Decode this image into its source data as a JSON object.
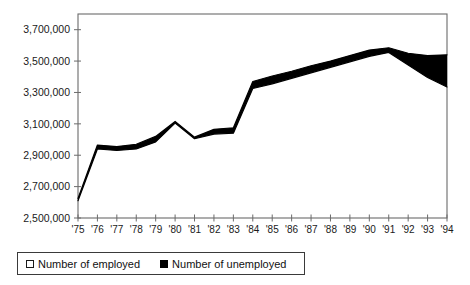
{
  "chart_data": {
    "type": "area",
    "title": "",
    "subtitle": "",
    "xlabel": "",
    "ylabel": "",
    "grid": false,
    "legend_position": "bottom-left",
    "ylim": [
      2500000,
      3800000
    ],
    "ytick_values": [
      2500000,
      2700000,
      2900000,
      3100000,
      3300000,
      3500000,
      3700000
    ],
    "ytick_labels": [
      "2,500,000",
      "2,700,000",
      "2,900,000",
      "3,100,000",
      "3,300,000",
      "3,500,000",
      "3,700,000"
    ],
    "categories": [
      "'75",
      "'76",
      "'77",
      "'78",
      "'79",
      "'80",
      "'81",
      "'82",
      "'83",
      "'84",
      "'85",
      "'86",
      "'87",
      "'88",
      "'89",
      "'90",
      "'91",
      "'92",
      "'93",
      "'94"
    ],
    "x": [
      1975,
      1976,
      1977,
      1978,
      1979,
      1980,
      1981,
      1982,
      1983,
      1984,
      1985,
      1986,
      1987,
      1988,
      1989,
      1990,
      1991,
      1992,
      1993,
      1994
    ],
    "series": [
      {
        "name": "Number of employed",
        "swatch": "open-square",
        "values": [
          2610000,
          2940000,
          2930000,
          2940000,
          2985000,
          3105000,
          3005000,
          3035000,
          3040000,
          3325000,
          3355000,
          3390000,
          3425000,
          3460000,
          3495000,
          3530000,
          3555000,
          3475000,
          3395000,
          3335000
        ]
      },
      {
        "name": "Number of unemployed",
        "swatch": "filled-square",
        "values": [
          15000,
          25000,
          25000,
          30000,
          35000,
          10000,
          10000,
          30000,
          35000,
          45000,
          50000,
          45000,
          45000,
          40000,
          40000,
          40000,
          30000,
          75000,
          140000,
          205000
        ]
      }
    ],
    "total_series": {
      "name": "Total labour force",
      "values": [
        2625000,
        2965000,
        2955000,
        2970000,
        3020000,
        3115000,
        3015000,
        3065000,
        3075000,
        3370000,
        3405000,
        3435000,
        3470000,
        3500000,
        3535000,
        3570000,
        3585000,
        3550000,
        3535000,
        3540000
      ]
    }
  },
  "legend": {
    "items": [
      {
        "label": "Number of employed",
        "swatch": "open-square"
      },
      {
        "label": "Number of unemployed",
        "swatch": "filled-square"
      }
    ]
  },
  "axes": {
    "y_labels": [
      "3,700,000",
      "3,500,000",
      "3,300,000",
      "3,100,000",
      "2,900,000",
      "2,700,000",
      "2,500,000"
    ],
    "x_labels": [
      "'75",
      "'76",
      "'77",
      "'78",
      "'79",
      "'80",
      "'81",
      "'82",
      "'83",
      "'84",
      "'85",
      "'86",
      "'87",
      "'88",
      "'89",
      "'90",
      "'91",
      "'92",
      "'93",
      "'94"
    ]
  },
  "colors": {
    "band_fill": "#000000",
    "line": "#000000",
    "frame": "#6b6b6b",
    "text": "#1a1a1a"
  }
}
